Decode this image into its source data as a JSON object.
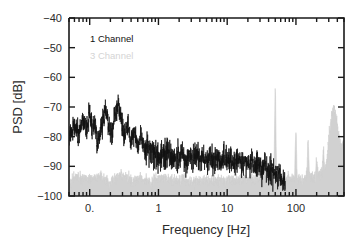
{
  "chart_data": {
    "type": "line",
    "title": "",
    "xlabel": "Frequency [Hz]",
    "ylabel": "PSD [dB]",
    "xscale": "log",
    "yscale": "linear",
    "xlim": [
      0.05,
      500
    ],
    "ylim": [
      -100,
      -40
    ],
    "grid": false,
    "legend_position": "upper-left-inside",
    "x_ticks": [
      {
        "value": 0.1,
        "label": "0."
      },
      {
        "value": 1,
        "label": "1"
      },
      {
        "value": 10,
        "label": "10"
      },
      {
        "value": 100,
        "label": "100"
      }
    ],
    "y_ticks": [
      {
        "value": -40,
        "label": "-40"
      },
      {
        "value": -50,
        "label": "-50"
      },
      {
        "value": -60,
        "label": "-60"
      },
      {
        "value": -70,
        "label": "-70"
      },
      {
        "value": -80,
        "label": "-80"
      },
      {
        "value": -90,
        "label": "-90"
      },
      {
        "value": -100,
        "label": "-100"
      }
    ],
    "series": [
      {
        "name": "1 Channel",
        "color": "#111111",
        "legend_label": "1 Channel",
        "x": [
          0.05,
          0.06,
          0.07,
          0.08,
          0.09,
          0.1,
          0.11,
          0.12,
          0.13,
          0.15,
          0.17,
          0.19,
          0.21,
          0.23,
          0.26,
          0.29,
          0.32,
          0.36,
          0.4,
          0.45,
          0.5,
          0.56,
          0.63,
          0.7,
          0.79,
          0.89,
          1.0,
          1.12,
          1.26,
          1.41,
          1.58,
          1.78,
          2.0,
          2.24,
          2.51,
          2.82,
          3.16,
          3.55,
          3.98,
          4.47,
          5.01,
          5.62,
          6.31,
          7.08,
          7.94,
          8.91,
          10.0,
          11.2,
          12.6,
          14.1,
          15.8,
          17.8,
          20.0,
          22.4,
          25.1,
          28.2,
          31.6,
          35.5,
          39.8,
          44.7,
          50.1,
          56.2,
          63.1,
          70.8,
          79.4,
          89.1,
          100.0
        ],
        "y": [
          -80.5,
          -76.0,
          -79.5,
          -73.5,
          -78.0,
          -71.0,
          -79.0,
          -75.5,
          -82.0,
          -77.0,
          -70.5,
          -76.5,
          -79.5,
          -73.0,
          -69.5,
          -74.0,
          -80.5,
          -76.0,
          -82.0,
          -78.5,
          -83.5,
          -80.0,
          -85.0,
          -82.5,
          -86.0,
          -84.0,
          -88.5,
          -85.5,
          -87.0,
          -84.5,
          -88.0,
          -86.5,
          -87.5,
          -85.0,
          -88.5,
          -86.0,
          -88.0,
          -85.5,
          -87.5,
          -86.5,
          -88.0,
          -86.0,
          -88.5,
          -87.0,
          -88.0,
          -86.5,
          -88.5,
          -87.5,
          -89.0,
          -87.0,
          -89.5,
          -88.0,
          -90.0,
          -88.5,
          -90.5,
          -89.0,
          -91.0,
          -90.0,
          -92.0,
          -91.0,
          -92.5,
          -92.0,
          -93.5,
          -93.0,
          -94.0,
          -94.0,
          -94.5
        ],
        "description": "Broadband noise: peaks near -70 dB around 0.1-0.3 Hz, rolls down to a dense -85 to -90 dB noise floor above 1 Hz, merging into the gray floor past 50 Hz"
      },
      {
        "name": "3 Channel",
        "color": "#cfcfcf",
        "legend_label": "3 Channel",
        "x": [
          0.05,
          0.07,
          0.1,
          0.14,
          0.2,
          0.28,
          0.4,
          0.56,
          0.79,
          1.12,
          1.58,
          2.24,
          3.16,
          4.47,
          6.31,
          8.91,
          12.6,
          17.8,
          25.1,
          35.5,
          50.1,
          70.8,
          100.0,
          141.0,
          200.0,
          282.0,
          354.0,
          400.0,
          447.0,
          500.0
        ],
        "y": [
          -95.0,
          -93.5,
          -94.5,
          -93.0,
          -95.5,
          -92.5,
          -95.0,
          -94.0,
          -95.5,
          -93.5,
          -95.0,
          -94.5,
          -95.5,
          -94.0,
          -95.0,
          -94.5,
          -95.0,
          -94.0,
          -94.5,
          -94.0,
          -94.5,
          -94.0,
          -94.5,
          -94.0,
          -93.5,
          -92.0,
          -89.0,
          -87.0,
          -85.0,
          -83.0
        ],
        "description": "Flat light-gray noise floor near -94 dB, rising broadly above 250 Hz toward -83 dB at the right edge"
      }
    ],
    "spikes": [
      {
        "series": "3 Channel",
        "frequency": 50,
        "peak_db": -64,
        "label": "mains 50 Hz line"
      },
      {
        "series": "3 Channel",
        "frequency": 100,
        "peak_db": -78,
        "label": "2nd harmonic"
      },
      {
        "series": "3 Channel",
        "frequency": 150,
        "peak_db": -81,
        "label": "3rd harmonic"
      },
      {
        "series": "3 Channel",
        "frequency": 200,
        "peak_db": -87,
        "label": "4th harmonic"
      },
      {
        "series": "3 Channel",
        "frequency": 250,
        "peak_db": -85,
        "label": "5th harmonic"
      },
      {
        "series": "3 Channel",
        "frequency": 300,
        "peak_db": -89,
        "label": "6th harmonic"
      },
      {
        "series": "3 Channel",
        "frequency": 350,
        "peak_db": -70,
        "label": "high-frequency rise"
      }
    ]
  },
  "legend": {
    "entries": [
      {
        "label": "1 Channel",
        "color": "#111111"
      },
      {
        "label": "3 Channel",
        "color": "#d4d4d4"
      }
    ]
  },
  "axes": {
    "x_title": "Frequency [Hz]",
    "y_title": "PSD [dB]"
  }
}
